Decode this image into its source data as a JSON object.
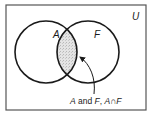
{
  "diagram": {
    "type": "venn",
    "universe_label": "U",
    "sets": [
      {
        "label": "A"
      },
      {
        "label": "F"
      }
    ],
    "intersection": {
      "shaded": true,
      "shade_color": "#d8d8d8",
      "annotation": {
        "parts": [
          "A",
          " and ",
          "F",
          ", ",
          "A",
          "∩",
          "F"
        ]
      }
    },
    "colors": {
      "stroke": "#1a1a1a",
      "frame": "#555555",
      "background": "#ffffff"
    }
  }
}
